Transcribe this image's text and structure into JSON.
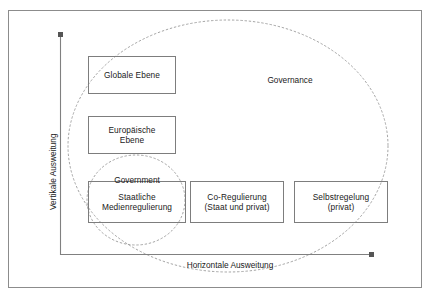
{
  "diagram": {
    "axes": {
      "vertical_label": "Vertikale Ausweitung",
      "horizontal_label": "Horizontale Ausweitung",
      "line_color": "#808080"
    },
    "regions": [
      {
        "id": "governance",
        "label": "Governance",
        "shape": "ellipse",
        "style": "dashed",
        "color": "#9a9a9a"
      },
      {
        "id": "government",
        "label": "Government",
        "shape": "circle",
        "style": "dashed",
        "color": "#9a9a9a"
      }
    ],
    "boxes": [
      {
        "id": "globale-ebene",
        "label": "Globale Ebene"
      },
      {
        "id": "europaeische-ebene",
        "label": "Europäische\nEbene"
      },
      {
        "id": "staatliche-medienregulierung",
        "label": "Staatliche\nMedienregulierung"
      },
      {
        "id": "co-regulierung",
        "label": "Co-Regulierung\n(Staat und privat)"
      },
      {
        "id": "selbstregelung",
        "label": "Selbstregelung\n(privat)"
      }
    ],
    "frame": {
      "border_color": "#8c8c8c"
    }
  }
}
